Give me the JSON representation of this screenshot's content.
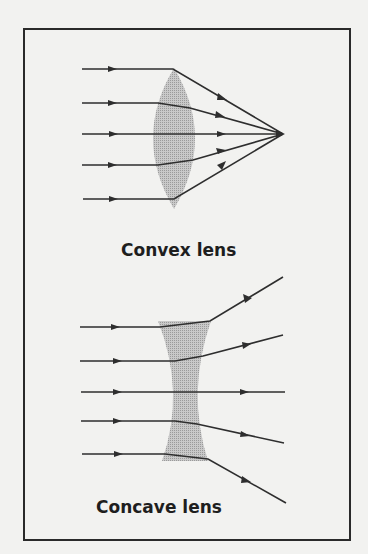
{
  "figure": {
    "background": "#f2f2f0",
    "frame_color": "#2a2a2a",
    "ray_color": "#2e2e2e",
    "lens_fill": "#b8b8b8"
  },
  "convex": {
    "label": "Convex lens",
    "focal_point": [
      283,
      134
    ],
    "rays": [
      {
        "y": 69,
        "bend_x": 173,
        "bend_y": 69
      },
      {
        "y": 103,
        "bend_x": 188,
        "bend_y": 107
      },
      {
        "y": 134,
        "bend_x": 190,
        "bend_y": 134
      },
      {
        "y": 165,
        "bend_x": 190,
        "bend_y": 161
      },
      {
        "y": 199,
        "bend_x": 175,
        "bend_y": 199
      }
    ]
  },
  "concave": {
    "label": "Concave lens",
    "rays": [
      {
        "y": 327,
        "bend_x": 210,
        "bend_y": 321,
        "end_x": 283,
        "end_y": 277
      },
      {
        "y": 361,
        "bend_x": 203,
        "bend_y": 356,
        "end_x": 283,
        "end_y": 335
      },
      {
        "y": 392,
        "bend_x": 195,
        "bend_y": 392,
        "end_x": 285,
        "end_y": 392
      },
      {
        "y": 421,
        "bend_x": 197,
        "bend_y": 424,
        "end_x": 284,
        "end_y": 443
      },
      {
        "y": 454,
        "bend_x": 208,
        "bend_y": 459,
        "end_x": 286,
        "end_y": 503
      }
    ]
  }
}
